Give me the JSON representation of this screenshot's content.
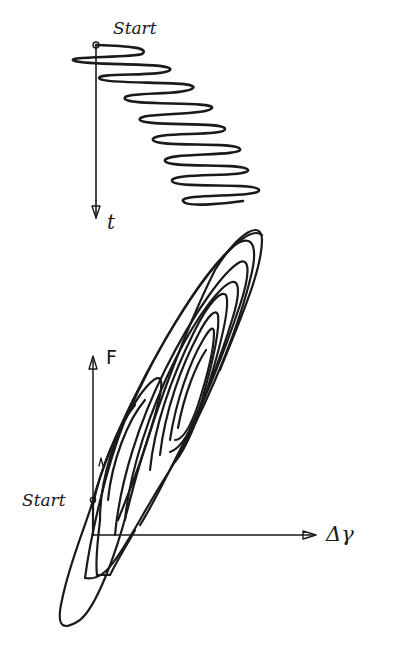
{
  "diagram": {
    "type": "hand-drawn sketch",
    "panels": [
      {
        "name": "time-signal",
        "description": "Oscillating signal drifting right over time, drawn along a downward time axis",
        "labels": {
          "start": "Start",
          "axis": "t"
        },
        "oscillation_count": 9
      },
      {
        "name": "hysteresis-loops",
        "description": "Nested elongated hysteresis loops in the force vs displacement plane",
        "labels": {
          "start": "Start",
          "y_axis": "F",
          "x_axis": "Δγ"
        },
        "loop_count": 8
      }
    ],
    "ink_color": "#1a1a1a",
    "background": "#ffffff"
  }
}
